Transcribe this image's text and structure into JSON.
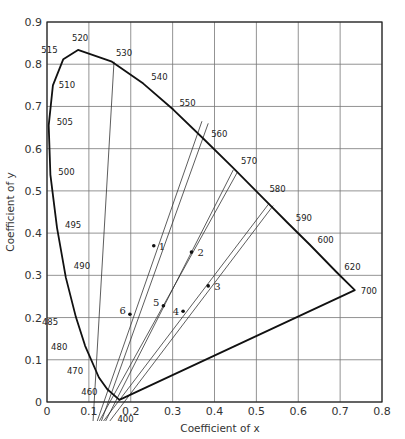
{
  "chart_data": {
    "type": "line",
    "title": "",
    "xlabel": "Coefficient of x",
    "ylabel": "Coefficient of y",
    "xlim": [
      0,
      0.8
    ],
    "ylim": [
      0,
      0.9
    ],
    "grid": true,
    "x_ticks": [
      "0",
      "0.1",
      "0.2",
      "0.3",
      "0.4",
      "0.5",
      "0.6",
      "0.7",
      "0.8"
    ],
    "y_ticks": [
      "0",
      "0.1",
      "0.2",
      "0.3",
      "0.4",
      "0.5",
      "0.6",
      "0.7",
      "0.8",
      "0.9"
    ],
    "spectral_locus": [
      {
        "nm": "400",
        "x": 0.173,
        "y": 0.005
      },
      {
        "nm": "460",
        "x": 0.144,
        "y": 0.03
      },
      {
        "nm": "470",
        "x": 0.124,
        "y": 0.058
      },
      {
        "nm": "480",
        "x": 0.091,
        "y": 0.133
      },
      {
        "nm": "485",
        "x": 0.069,
        "y": 0.201
      },
      {
        "nm": "490",
        "x": 0.045,
        "y": 0.295
      },
      {
        "nm": "495",
        "x": 0.024,
        "y": 0.413
      },
      {
        "nm": "500",
        "x": 0.008,
        "y": 0.538
      },
      {
        "nm": "505",
        "x": 0.004,
        "y": 0.655
      },
      {
        "nm": "510",
        "x": 0.014,
        "y": 0.75
      },
      {
        "nm": "515",
        "x": 0.039,
        "y": 0.812
      },
      {
        "nm": "520",
        "x": 0.074,
        "y": 0.834
      },
      {
        "nm": "530",
        "x": 0.155,
        "y": 0.806
      },
      {
        "nm": "540",
        "x": 0.23,
        "y": 0.754
      },
      {
        "nm": "550",
        "x": 0.302,
        "y": 0.692
      },
      {
        "nm": "560",
        "x": 0.373,
        "y": 0.624
      },
      {
        "nm": "570",
        "x": 0.444,
        "y": 0.555
      },
      {
        "nm": "580",
        "x": 0.512,
        "y": 0.487
      },
      {
        "nm": "590",
        "x": 0.575,
        "y": 0.424
      },
      {
        "nm": "600",
        "x": 0.627,
        "y": 0.373
      },
      {
        "nm": "620",
        "x": 0.691,
        "y": 0.308
      },
      {
        "nm": "700",
        "x": 0.735,
        "y": 0.265
      }
    ],
    "points": [
      {
        "label": "1",
        "x": 0.255,
        "y": 0.37
      },
      {
        "label": "2",
        "x": 0.345,
        "y": 0.355
      },
      {
        "label": "3",
        "x": 0.385,
        "y": 0.275
      },
      {
        "label": "4",
        "x": 0.325,
        "y": 0.215
      },
      {
        "label": "5",
        "x": 0.278,
        "y": 0.228
      },
      {
        "label": "6",
        "x": 0.198,
        "y": 0.208
      }
    ],
    "construction_lines": [
      {
        "from": [
          0.12,
          -0.045
        ],
        "to": [
          0.37,
          0.665
        ]
      },
      {
        "from": [
          0.13,
          -0.045
        ],
        "to": [
          0.385,
          0.66
        ]
      },
      {
        "from": [
          0.11,
          -0.045
        ],
        "to": [
          0.16,
          0.806
        ]
      },
      {
        "from": [
          0.125,
          -0.045
        ],
        "to": [
          0.455,
          0.545
        ]
      },
      {
        "from": [
          0.14,
          -0.045
        ],
        "to": [
          0.445,
          0.55
        ]
      },
      {
        "from": [
          0.135,
          -0.045
        ],
        "to": [
          0.53,
          0.47
        ]
      },
      {
        "from": [
          0.15,
          -0.045
        ],
        "to": [
          0.54,
          0.465
        ]
      }
    ]
  }
}
